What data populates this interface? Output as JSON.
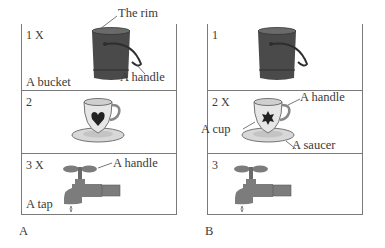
{
  "panels": [
    {
      "caption": "A",
      "rows": [
        {
          "number": "1 X",
          "object": "bucket",
          "labels": {
            "top": "The rim",
            "handle": "A handle",
            "name": "A bucket"
          }
        },
        {
          "number": "2",
          "object": "cup",
          "icon": "heart"
        },
        {
          "number": "3 X",
          "object": "tap",
          "labels": {
            "handle": "A handle",
            "name": "A tap"
          }
        }
      ]
    },
    {
      "caption": "B",
      "rows": [
        {
          "number": "1",
          "object": "bucket"
        },
        {
          "number": "2 X",
          "object": "cup",
          "icon": "star",
          "labels": {
            "handle": "A handle",
            "cup": "A cup",
            "saucer": "A saucer"
          }
        },
        {
          "number": "3",
          "object": "tap"
        }
      ]
    }
  ],
  "colors": {
    "bucket": "#4a4a4a",
    "tap": "#7c7c7c",
    "cup": "#e4e4e4",
    "line": "#7a7a7a",
    "text": "#3a3a3a"
  }
}
